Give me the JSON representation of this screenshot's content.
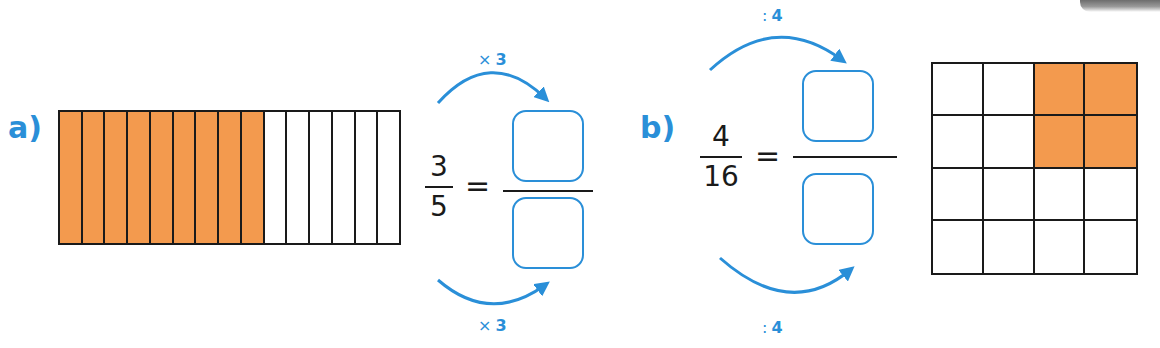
{
  "colors": {
    "accent": "#2a8fd8",
    "fill": "#f39a4e",
    "line": "#1a1a1a"
  },
  "exercise_a": {
    "label": "a)",
    "strip": {
      "columns": 15,
      "filled": 9
    },
    "fraction": {
      "numerator": "3",
      "denominator": "5"
    },
    "equals": "=",
    "top_operation": {
      "symbol": "×",
      "value": "3"
    },
    "bottom_operation": {
      "symbol": "×",
      "value": "3"
    },
    "answer": {
      "numerator": "",
      "denominator": ""
    }
  },
  "exercise_b": {
    "label": "b)",
    "grid": {
      "rows": 4,
      "columns": 4,
      "filled_cells": [
        [
          0,
          2
        ],
        [
          0,
          3
        ],
        [
          1,
          2
        ],
        [
          1,
          3
        ]
      ]
    },
    "fraction": {
      "numerator": "4",
      "denominator": "16"
    },
    "equals": "=",
    "top_operation": {
      "symbol": ":",
      "value": "4"
    },
    "bottom_operation": {
      "symbol": ":",
      "value": "4"
    },
    "answer": {
      "numerator": "",
      "denominator": ""
    }
  },
  "icons": {
    "arrow": "curved-arrow-icon"
  }
}
